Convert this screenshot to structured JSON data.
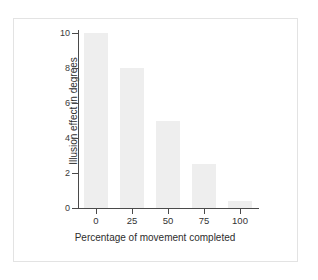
{
  "chart_data": {
    "type": "bar",
    "title": "",
    "subtitle": "",
    "xlabel": "Percentage of movement completed",
    "ylabel": "Illusion effect in degrees",
    "categories": [
      "0",
      "25",
      "50",
      "75",
      "100"
    ],
    "values": [
      10,
      8,
      5,
      2.5,
      0.4
    ],
    "series": [
      {
        "name": "Illusion effect",
        "values": [
          10,
          8,
          5,
          2.5,
          0.4
        ]
      }
    ],
    "xlim": [
      -0.5,
      4.5
    ],
    "ylim": [
      0,
      10
    ],
    "y_ticks": [
      0,
      2,
      4,
      6,
      8,
      10
    ],
    "y_tick_labels": [
      "0",
      "2",
      "4",
      "6",
      "8",
      "10"
    ],
    "x_ticks": [
      0,
      25,
      50,
      75,
      100
    ],
    "x_tick_labels": [
      "0",
      "25",
      "50",
      "75",
      "100"
    ],
    "grid": false,
    "legend": false,
    "legend_position": "none",
    "annotations": [],
    "colors": {
      "bar_fill": "#eeeeee",
      "axis_line": "#4a4a4a",
      "tick_label": "#333333",
      "axis_title": "#2e2e2e",
      "background": "#ffffff",
      "frame_border": "#e3e3e3"
    }
  },
  "figure": {
    "background": "#ffffff",
    "frame_label": "chart-frame"
  }
}
